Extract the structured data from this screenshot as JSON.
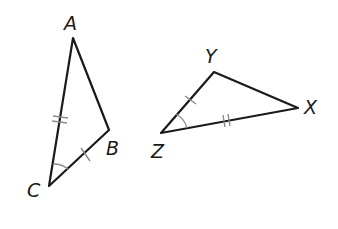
{
  "diagram": {
    "type": "congruent-triangles",
    "triangles": [
      {
        "name": "ABC",
        "vertices": {
          "A": {
            "label": "A",
            "x": 73,
            "y": 38
          },
          "B": {
            "label": "B",
            "x": 109,
            "y": 130
          },
          "C": {
            "label": "C",
            "x": 49,
            "y": 186
          }
        },
        "marks": {
          "AC": "double-tick",
          "CB": "single-tick",
          "angle_C": "single-arc"
        }
      },
      {
        "name": "XYZ",
        "vertices": {
          "Y": {
            "label": "Y",
            "x": 214,
            "y": 72
          },
          "X": {
            "label": "X",
            "x": 298,
            "y": 108
          },
          "Z": {
            "label": "Z",
            "x": 161,
            "y": 133
          }
        },
        "marks": {
          "ZX": "double-tick",
          "ZY": "single-tick",
          "angle_Z": "single-arc"
        }
      }
    ],
    "colors": {
      "edge": "#1a1a1a",
      "mark": "#8a8a8a",
      "background": "#ffffff"
    }
  }
}
